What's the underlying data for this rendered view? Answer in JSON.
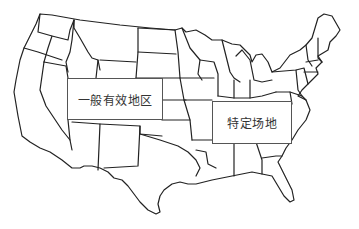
{
  "map": {
    "subject": "United States state outline map",
    "line_color": "#222222",
    "background": "#ffffff"
  },
  "labels": {
    "general_area": "一般有效地区",
    "specific_site": "特定场地"
  }
}
